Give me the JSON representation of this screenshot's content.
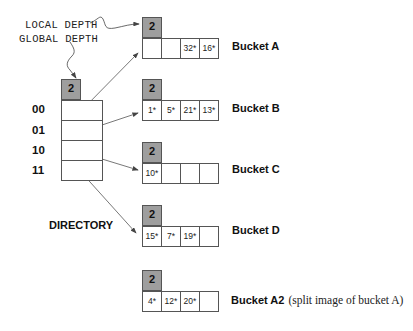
{
  "annotations": {
    "local_depth": "LOCAL DEPTH",
    "global_depth": "GLOBAL DEPTH",
    "directory": "DIRECTORY"
  },
  "directory": {
    "global_depth": "2",
    "entries": [
      {
        "label": "00",
        "points_to": "Bucket A"
      },
      {
        "label": "01",
        "points_to": "Bucket B"
      },
      {
        "label": "10",
        "points_to": "Bucket C"
      },
      {
        "label": "11",
        "points_to": "Bucket D"
      }
    ]
  },
  "buckets": [
    {
      "name": "Bucket A",
      "local_depth": "2",
      "entries": [
        "",
        "",
        "32*",
        "16*"
      ],
      "note": ""
    },
    {
      "name": "Bucket B",
      "local_depth": "2",
      "entries": [
        "1*",
        "5*",
        "21*",
        "13*"
      ],
      "note": ""
    },
    {
      "name": "Bucket C",
      "local_depth": "2",
      "entries": [
        "10*",
        "",
        "",
        ""
      ],
      "note": ""
    },
    {
      "name": "Bucket D",
      "local_depth": "2",
      "entries": [
        "15*",
        "7*",
        "19*",
        ""
      ],
      "note": ""
    },
    {
      "name": "Bucket A2",
      "local_depth": "2",
      "entries": [
        "4*",
        "12*",
        "20*",
        ""
      ],
      "note": "(split image of bucket A)"
    }
  ]
}
